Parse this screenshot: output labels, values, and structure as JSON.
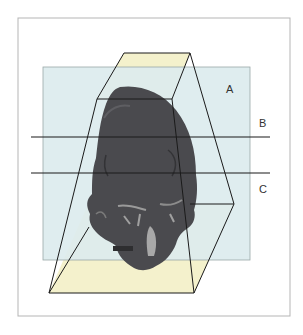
{
  "figure": {
    "labels": {
      "a": "A",
      "b": "B",
      "c": "C"
    },
    "colors": {
      "frame": "#b0b0b0",
      "plane_a": "#dcecee",
      "box_faces": "#f4f1cc",
      "lines": "#1a1a1a",
      "skull": "#4a4a4e"
    }
  }
}
